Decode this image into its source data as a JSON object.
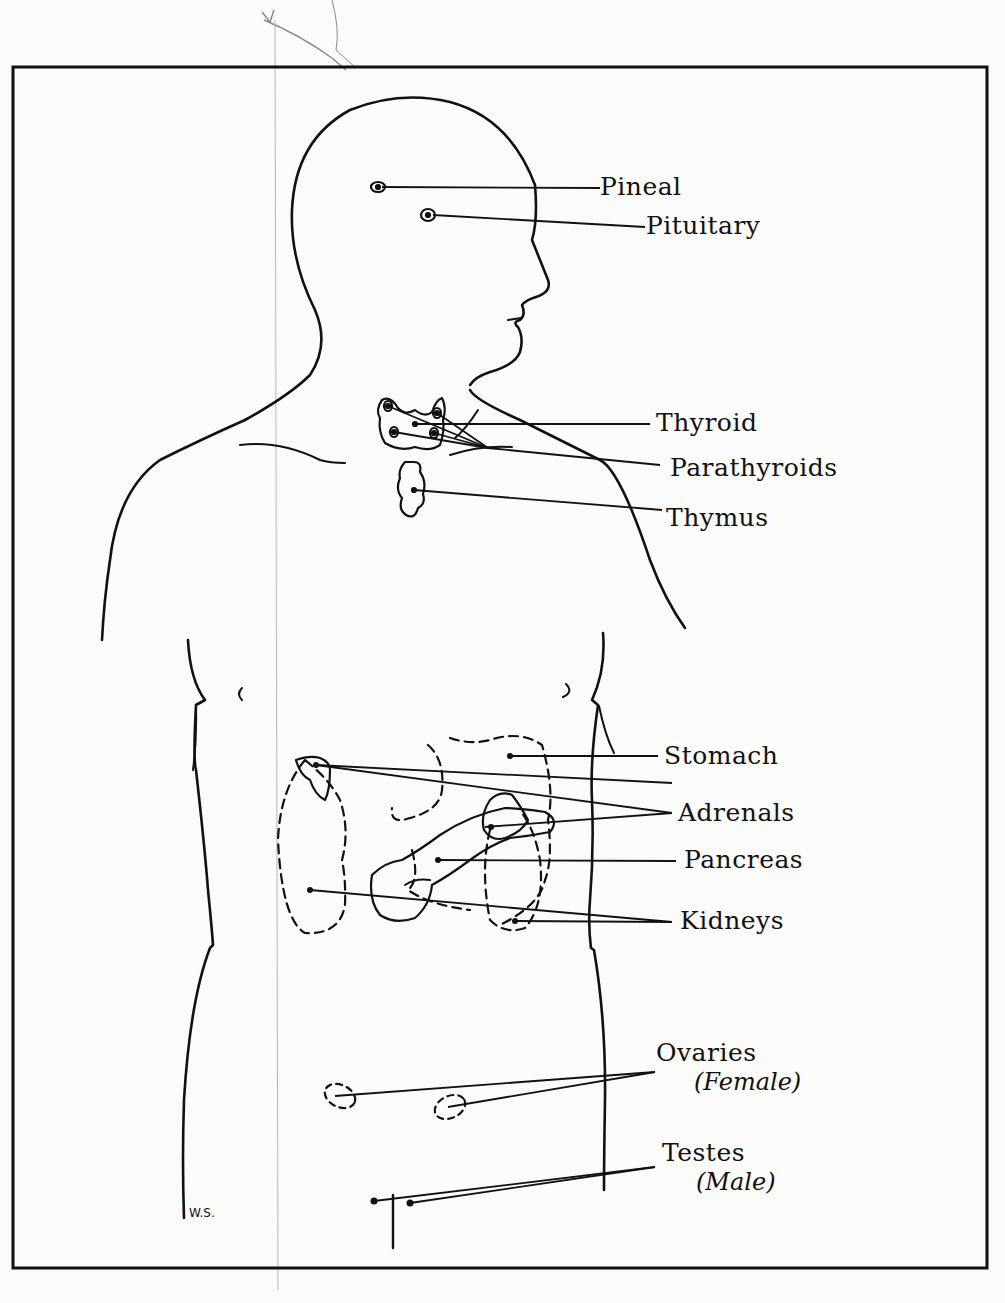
{
  "diagram": {
    "type": "anatomical illustration",
    "colors": {
      "ink": "#111111",
      "paper": "#fbfbf9",
      "pencil": "#8a8a8a"
    },
    "labels": {
      "pineal": "Pineal",
      "pituitary": "Pituitary",
      "thyroid": "Thyroid",
      "parathyroids": "Parathyroids",
      "thymus": "Thymus",
      "stomach": "Stomach",
      "adrenals": "Adrenals",
      "pancreas": "Pancreas",
      "kidneys": "Kidneys",
      "ovaries": "Ovaries",
      "ovaries_note": "(Female)",
      "testes": "Testes",
      "testes_note": "(Male)"
    },
    "signature": "W.S."
  }
}
